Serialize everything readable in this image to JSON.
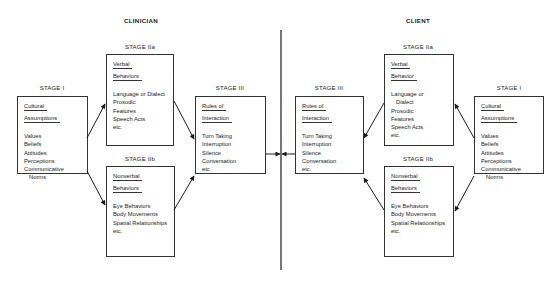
{
  "clinician": {
    "title": "CLINICIAN",
    "stage1": {
      "label": "STAGE I",
      "heading": [
        "Cultural",
        "Assumptions"
      ],
      "items": [
        "Values",
        "Beliefs",
        "Attitudes",
        "Perceptions",
        "Communicative",
        "Norms"
      ]
    },
    "stage2a": {
      "label": "STAGE IIa",
      "heading": [
        "Verbal",
        "Behaviors"
      ],
      "items": [
        "Language or Dialect",
        "Prosodic",
        "Features",
        "Speech Acts",
        "etc."
      ]
    },
    "stage2b": {
      "label": "STAGE IIb",
      "heading": [
        "Nonverbal",
        "Behaviors"
      ],
      "items": [
        "Eye Behaviors",
        "Body Movements",
        "Spatial Relationships",
        "etc."
      ]
    },
    "stage3": {
      "label": "STAGE III",
      "heading": [
        "Rules of",
        "Interaction"
      ],
      "items": [
        "Turn Taking",
        "Interruption",
        "Silence",
        "Conversation",
        "etc."
      ]
    }
  },
  "client": {
    "title": "CLIENT",
    "stage1": {
      "label": "STAGE I",
      "heading": [
        "Cultural",
        "Assumptions"
      ],
      "items": [
        "Values",
        "Beliefs",
        "Attitudes",
        "Perceptions",
        "Communicative",
        "Norms"
      ]
    },
    "stage2a": {
      "label": "STAGE IIa",
      "heading": [
        "Verbal",
        "Behavior"
      ],
      "items": [
        "Language or",
        "Dialect",
        "Prosodic",
        "Features",
        "Speech Acts",
        "etc."
      ]
    },
    "stage2b": {
      "label": "STAGE IIb",
      "heading": [
        "Nonverbal",
        "Behaviors"
      ],
      "items": [
        "Eye Behaviors",
        "Body Movements",
        "Spatial Relationships",
        "etc."
      ]
    },
    "stage3": {
      "label": "STAGE III",
      "heading": [
        "Rules of",
        "Interaction"
      ],
      "items": [
        "Turn Taking",
        "Interruption",
        "Silence",
        "Conversation",
        "etc."
      ]
    }
  },
  "colors": {
    "line": "#1a1a1a",
    "box_border": "#333333",
    "background": "#ffffff"
  }
}
